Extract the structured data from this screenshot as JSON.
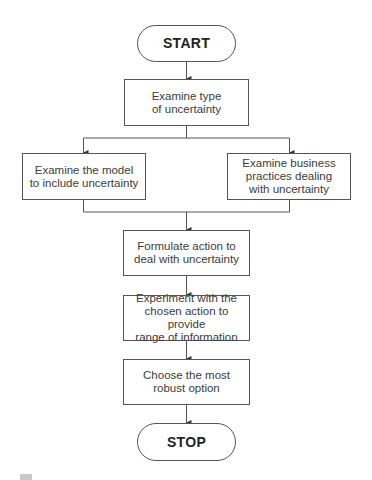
{
  "flowchart": {
    "start": {
      "label": "START"
    },
    "steps": [
      {
        "id": "examine-type",
        "label": "Examine type\nof uncertainty"
      },
      {
        "id": "examine-model",
        "label": "Examine the model\nto include uncertainty"
      },
      {
        "id": "examine-business",
        "label": "Examine business\npractices dealing\nwith uncertainty"
      },
      {
        "id": "formulate-action",
        "label": "Formulate action to\ndeal with uncertainty"
      },
      {
        "id": "experiment",
        "label": "Experiment with the\nchosen action to provide\nrange of information"
      },
      {
        "id": "choose-robust",
        "label": "Choose the most\nrobust option"
      }
    ],
    "stop": {
      "label": "STOP"
    },
    "edges": [
      [
        "start",
        "examine-type"
      ],
      [
        "examine-type",
        "examine-model"
      ],
      [
        "examine-type",
        "examine-business"
      ],
      [
        "examine-model",
        "formulate-action"
      ],
      [
        "examine-business",
        "formulate-action"
      ],
      [
        "formulate-action",
        "experiment"
      ],
      [
        "experiment",
        "choose-robust"
      ],
      [
        "choose-robust",
        "stop"
      ]
    ]
  },
  "colors": {
    "line": "#555555",
    "text": "#3c3c3c",
    "background": "#ffffff"
  }
}
